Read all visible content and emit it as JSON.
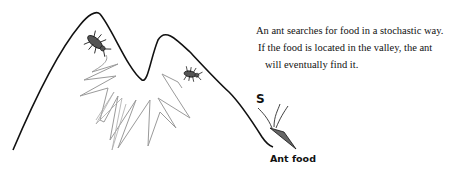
{
  "caption": {
    "lines": [
      "An ant searches for food in a stochastic way.",
      "If the food is located in the valley, the ant",
      "will eventually find it."
    ]
  },
  "labels": {
    "food": "Ant food",
    "start_marker": "S"
  },
  "colors": {
    "line": "#111111",
    "ant_body": "#555555",
    "path_trace": "#9a9a9a",
    "food": "#666666"
  }
}
